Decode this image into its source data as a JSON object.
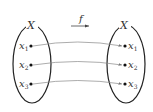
{
  "diagram": {
    "type": "function-mapping",
    "function_label": "f",
    "domain_set": {
      "label": "X",
      "elements": [
        {
          "name": "x",
          "sub": "1"
        },
        {
          "name": "x",
          "sub": "2"
        },
        {
          "name": "x",
          "sub": "3"
        }
      ]
    },
    "codomain_set": {
      "label": "X",
      "elements": [
        {
          "name": "x",
          "sub": "1"
        },
        {
          "name": "x",
          "sub": "2"
        },
        {
          "name": "x",
          "sub": "3"
        }
      ]
    },
    "mappings": [
      {
        "from": "x1",
        "to": "x1"
      },
      {
        "from": "x2",
        "to": "x2"
      },
      {
        "from": "x3",
        "to": "x3"
      }
    ],
    "colors": {
      "ellipse": "#222222",
      "arrow": "#888888",
      "text": "#333333"
    }
  }
}
